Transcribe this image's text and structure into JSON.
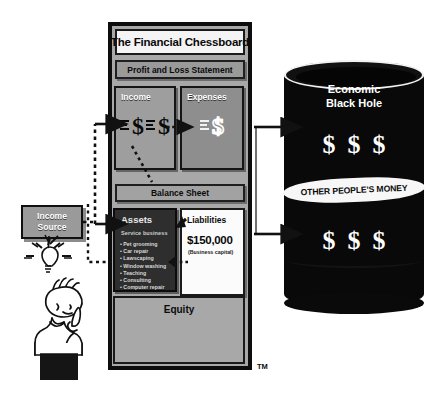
{
  "diagram": {
    "frame_title": "The Financial Chessboard",
    "trademark": "TM",
    "sections": {
      "profit_loss_label": "Profit and Loss Statement",
      "balance_sheet_label": "Balance Sheet",
      "equity_label": "Equity"
    },
    "income_panel": {
      "label": "Income",
      "symbol_1": "$",
      "symbol_2": "$"
    },
    "expenses_panel": {
      "label": "Expenses",
      "symbol_1": "$"
    },
    "assets_panel": {
      "label": "Assets",
      "subtitle": "Service business",
      "items": [
        "Pet grooming",
        "Car repair",
        "Lawscaping",
        "Window washing",
        "Teaching",
        "Consulting",
        "Computer repair"
      ]
    },
    "liabilities_panel": {
      "label": "Liabilities",
      "amount": "$150,000",
      "note": "(Business capital)"
    },
    "income_source": {
      "line_1": "Income",
      "line_2": "Source"
    },
    "barrel": {
      "title_line_1": "Economic",
      "title_line_2": "Black Hole",
      "band_label": "OTHER PEOPLE'S MONEY",
      "money_top": [
        "$",
        "$",
        "$"
      ],
      "money_bottom": [
        "$",
        "$",
        "$"
      ]
    },
    "icons": {
      "lightbulb": "lightbulb-icon",
      "thinker": "thinking-person-icon",
      "arrow_right": "arrow-right-icon",
      "dotted_arrow": "dotted-arrow-icon"
    },
    "colors": {
      "frame_bg": "#a8a8a8",
      "panel_bg": "#9e9e9e",
      "assets_bg": "#2e2e2e",
      "barrel_bg": "#090909",
      "band_bg": "#f7f7f7",
      "outline": "#0d0d0d"
    }
  }
}
